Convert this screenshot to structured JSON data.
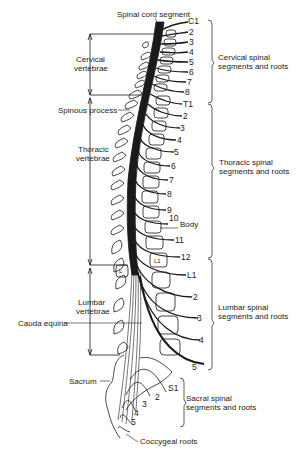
{
  "diagram": {
    "title_label": "Spinal cord segment",
    "left_labels": {
      "cervical_vertebrae_1": "Cervical",
      "cervical_vertebrae_2": "vertebrae",
      "spinous_process": "Spinous process",
      "thoracic_vertebrae_1": "Thoracic",
      "thoracic_vertebrae_2": "vertebrae",
      "lumbar_vertebrae_1": "Lumbar",
      "lumbar_vertebrae_2": "vertebrae",
      "cauda_equina": "Cauda equina",
      "sacrum": "Sacrum",
      "coccygeal_roots": "Coccygeal roots"
    },
    "right_groups": {
      "cervical_1": "Cervical spinal",
      "cervical_2": "segments and roots",
      "thoracic_1": "Thoracic spinal",
      "thoracic_2": "segments and roots",
      "lumbar_1": "Lumbar spinal",
      "lumbar_2": "segments and roots",
      "sacral_1": "Sacral spinal",
      "sacral_2": "segments and roots"
    },
    "body_label": "Body",
    "inner_label_l1": "L1",
    "inner_label_l": "L",
    "cervical_roots": [
      "C1",
      "2",
      "3",
      "4",
      "5",
      "6",
      "7",
      "8"
    ],
    "thoracic_roots": [
      "T1",
      "2",
      "3",
      "4",
      "5",
      "6",
      "7",
      "8",
      "9",
      "10",
      "11",
      "12"
    ],
    "lumbar_roots": [
      "L1",
      "2",
      "3",
      "4",
      "5"
    ],
    "sacral_roots": [
      "S1",
      "2",
      "3",
      "4",
      "5"
    ],
    "colors": {
      "ink": "#1a1a1a",
      "background": "#ffffff"
    }
  }
}
